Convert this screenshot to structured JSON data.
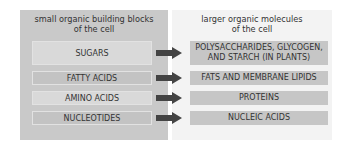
{
  "left_panel": {
    "heading_line1": "small organic building blocks",
    "heading_line2": "of the cell",
    "items": [
      "SUGARS",
      "FATTY ACIDS",
      "AMINO ACIDS",
      "NUCLEOTIDES"
    ]
  },
  "right_panel": {
    "heading_line1": "larger organic molecules",
    "heading_line2": "of the cell",
    "items": [
      {
        "line1": "POLYSACCHARIDES, GLYCOGEN,",
        "line2": "AND STARCH (IN PLANTS)"
      },
      {
        "line1": "FATS AND MEMBRANE LIPIDS",
        "line2": ""
      },
      {
        "line1": "PROTEINS",
        "line2": ""
      },
      {
        "line1": "NUCLEIC ACIDS",
        "line2": ""
      }
    ]
  },
  "colors": {
    "left_panel": "#c9c9c9",
    "right_panel": "#f3f3f3",
    "arrow": "#444444"
  }
}
